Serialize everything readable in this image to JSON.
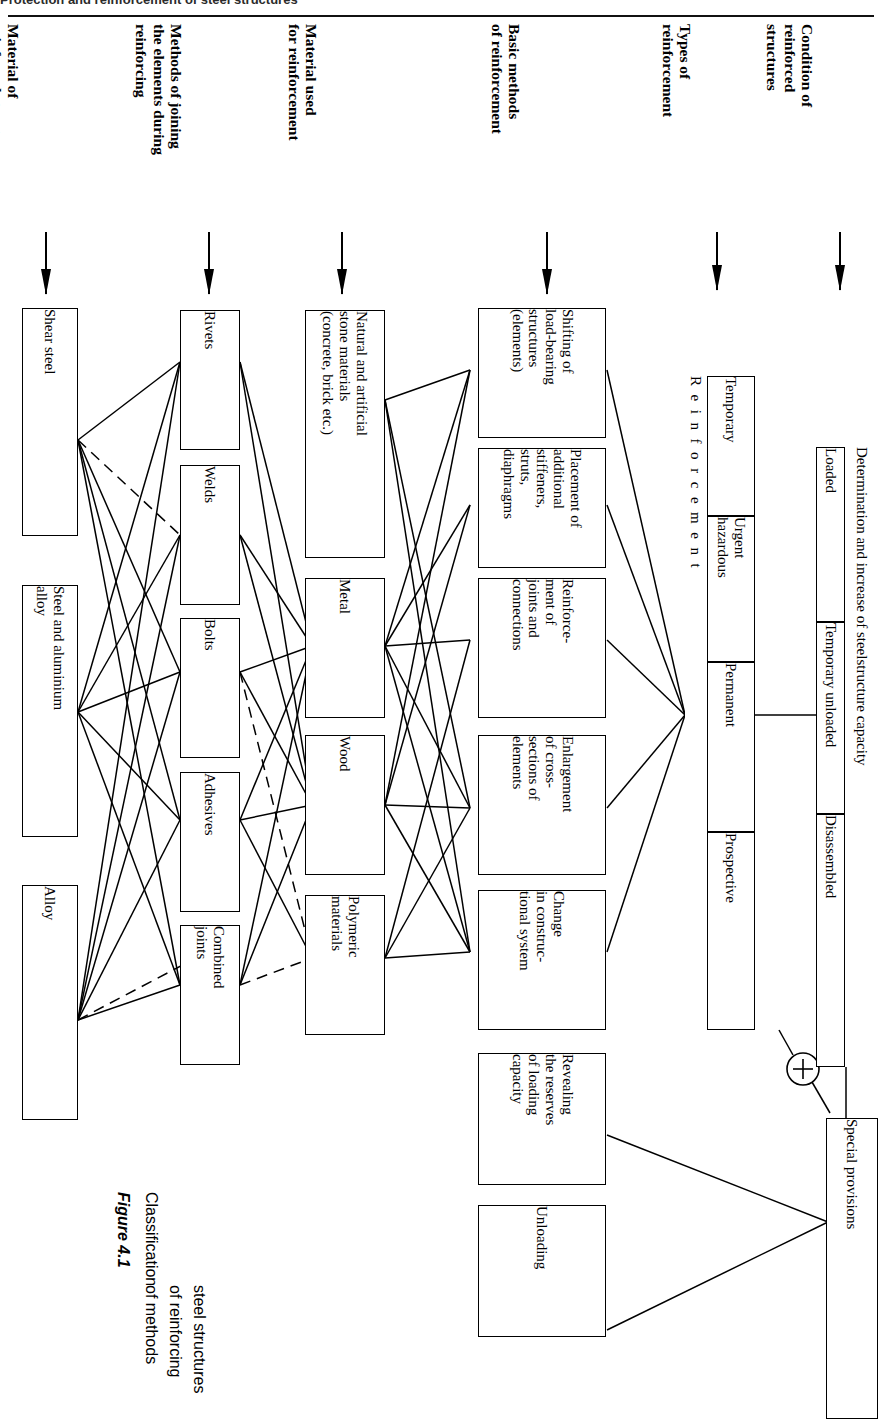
{
  "page": {
    "running_head": "Protection and reinforcement of steel structures",
    "rotation_note": "diagram rendered rotated 90 degrees"
  },
  "caption": {
    "figure_label": "Figure 4.1",
    "lines": [
      "Classification",
      "of methods",
      "of reinforcing",
      "steel structures"
    ]
  },
  "columns": [
    {
      "id": "material-of-reinforced-structures",
      "title": "Material of\nreinforced structures"
    },
    {
      "id": "methods-of-joining",
      "title": "Methods of joining\nthe elements during\nreinforcing"
    },
    {
      "id": "material-used-for-reinforcement",
      "title": "Material used\nfor reinforcement"
    },
    {
      "id": "basic-methods-of-reinforcement",
      "title": "Basic methods\nof reinforcement"
    },
    {
      "id": "types-of-reinforcement",
      "title": "Types of\nreinforcement"
    },
    {
      "id": "condition-of-reinforced-structures",
      "title": "Condition of\nreinforced\nstructures"
    }
  ],
  "boxes": {
    "material_of_reinforced_structures": [
      {
        "id": "shear-steel",
        "label": "Shear steel"
      },
      {
        "id": "steel-and-aluminium-alloy",
        "label": "Steel and aluminium\nalloy"
      },
      {
        "id": "alloy",
        "label": "Alloy"
      }
    ],
    "methods_of_joining": [
      {
        "id": "rivets",
        "label": "Rivets"
      },
      {
        "id": "welds",
        "label": "Welds"
      },
      {
        "id": "bolts",
        "label": "Bolts"
      },
      {
        "id": "adhesives",
        "label": "Adhesives"
      },
      {
        "id": "combined-joints",
        "label": "Combined\njoints"
      }
    ],
    "material_used_for_reinforcement": [
      {
        "id": "natural-and-artificial-stone-materials",
        "label": "Natural and artificial\nstone materials\n(concrete, brick etc.)"
      },
      {
        "id": "metal",
        "label": "Metal"
      },
      {
        "id": "wood",
        "label": "Wood"
      },
      {
        "id": "polymeric-materials",
        "label": "Polymeric\nmaterials"
      }
    ],
    "basic_methods_of_reinforcement": [
      {
        "id": "shifting-of-load-bearing-structures",
        "label": "Shifting of\nload-bearing\nstructures\n(elements)"
      },
      {
        "id": "placement-of-additional-stiffeners",
        "label": "Placement of\nadditional\nstiffeners,\nstruts,\ndiaphragms"
      },
      {
        "id": "reinforcement-of-joints-and-connections",
        "label": "Reinforce-\nment of\njoints and\nconnections"
      },
      {
        "id": "enlargement-of-cross-sections",
        "label": "Enlargement\nof cross-\nsections of\nelements"
      },
      {
        "id": "change-in-constructional-system",
        "label": "Change\nin construc-\ntional system"
      },
      {
        "id": "revealing-the-reserves-of-loading-capacity",
        "label": "Revealing\nthe reserves\nof loading\ncapacity"
      },
      {
        "id": "unloading",
        "label": "Unloading"
      }
    ],
    "types_of_reinforcement": {
      "spine_label": "R e i n f o r c e m e n t",
      "items": [
        {
          "id": "temporary",
          "label": "Temporary"
        },
        {
          "id": "urgent-hazardous",
          "label": "Urgent\nhazardous"
        },
        {
          "id": "permanent",
          "label": "Permanent"
        },
        {
          "id": "prospective",
          "label": "Prospective"
        }
      ]
    },
    "condition_of_reinforced_structures": {
      "spine_label": "Determination and increase of steelstructure capacity",
      "items": [
        {
          "id": "loaded",
          "label": "Loaded"
        },
        {
          "id": "temporary-unloaded",
          "label": "Temporary unloaded"
        },
        {
          "id": "disassembled",
          "label": "Disassembled"
        }
      ]
    },
    "special": [
      {
        "id": "special-provisions",
        "label": "Special provisions"
      }
    ]
  },
  "junction": {
    "plus_node": "+"
  },
  "colors": {
    "ink": "#000000",
    "paper": "#ffffff",
    "runhead": "#2b2b2b"
  }
}
